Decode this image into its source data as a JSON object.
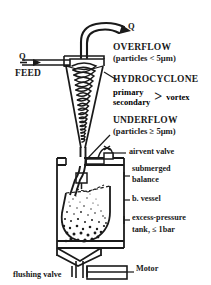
{
  "figure": {
    "type": "process-flow-diagram",
    "ink_color": "#1a1a1a",
    "background_color": "#ffffff"
  },
  "labels": {
    "q_overflow": "Q",
    "q_feed": "Q",
    "feed": "FEED",
    "overflow_title": "OVERFLOW",
    "overflow_spec": "(particles  < 5µm)",
    "hydrocyclone": "HYDROCYCLONE",
    "vortex_primary": "primary",
    "vortex_secondary": "secondary",
    "vortex_brace": ">",
    "vortex": "vortex",
    "underflow_title": "UNDERFLOW",
    "underflow_spec": "(particles ≥ 5µm)",
    "airvent_valve": "airvent valve",
    "submerged": "submerged",
    "balance": "balance",
    "b_vessel": "b. vessel",
    "excess_pressure": "excess-pressure",
    "tank_rating": "tank, ≤ 1bar",
    "motor": "Motor",
    "flushing_valve": "flushing valve"
  },
  "components": [
    {
      "name": "overflow-pipe",
      "description": "curved vortex finder pipe exiting top of cyclone"
    },
    {
      "name": "feed-pipe",
      "description": "horizontal tangential inlet duct on left"
    },
    {
      "name": "hydrocyclone-body",
      "description": "conical separator with helical spiral vortex"
    },
    {
      "name": "spiral-vortex",
      "description": "helical coil inside cyclone cone",
      "turns": 11
    },
    {
      "name": "underflow-pipe",
      "description": "apex discharge tube into vessel"
    },
    {
      "name": "airvent-valve",
      "description": "domed vent valve on tank lid"
    },
    {
      "name": "submerged-balance",
      "description": "small square balance pan suspended in tank"
    },
    {
      "name": "b-vessel",
      "description": "sedimentation beaker inside tank"
    },
    {
      "name": "excess-pressure-tank",
      "description": "outer rectangular pressure tank"
    },
    {
      "name": "sediment",
      "description": "settling particle cloud in beaker"
    },
    {
      "name": "flushing-valve",
      "description": "valve on bottom drain line"
    },
    {
      "name": "motor",
      "description": "drive motor block at bottom right"
    }
  ]
}
